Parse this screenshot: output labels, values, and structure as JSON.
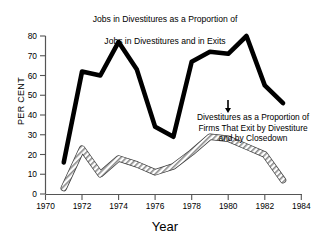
{
  "chart_data": {
    "type": "line",
    "title": "Jobs in Divestitures as a Proportion of Jobs in Divestitures and in Exits",
    "title_lines": [
      "Jobs in Divestitures as a Proportion of",
      "Jobs in Divestitures and in Exits"
    ],
    "xlabel": "Year",
    "ylabel": "PER CENT",
    "xlim": [
      1970,
      1984
    ],
    "ylim": [
      0,
      80
    ],
    "xticks": [
      1970,
      1972,
      1974,
      1976,
      1978,
      1980,
      1982,
      1984
    ],
    "xtick_labels": [
      "1970",
      "1972",
      "1974",
      "1976",
      "1978",
      "1980",
      "1982",
      "1984"
    ],
    "yticks": [
      0,
      10,
      20,
      30,
      40,
      50,
      60,
      70,
      80
    ],
    "ytick_labels": [
      "0",
      "10",
      "20",
      "30",
      "40",
      "50",
      "60",
      "70",
      "80"
    ],
    "grid": false,
    "legend": "annotations",
    "x": [
      1971,
      1972,
      1973,
      1974,
      1975,
      1976,
      1977,
      1978,
      1979,
      1980,
      1981,
      1982,
      1983
    ],
    "series": [
      {
        "name": "Jobs in Divestitures as a Proportion of Jobs in Divestitures and in Exits",
        "style": "thick-black",
        "color": "#000000",
        "values": [
          16,
          62,
          60,
          77,
          63,
          34,
          29,
          67,
          72,
          71,
          80,
          55,
          46
        ]
      },
      {
        "name": "Divestitures as a Proportion of Firms That Exit by Divestiture and by Closedown",
        "style": "hatched-grey",
        "color": "#808080",
        "values": [
          3,
          23,
          10,
          18,
          15,
          11,
          14,
          21,
          29,
          28,
          24,
          20,
          7
        ]
      }
    ],
    "annotations": [
      {
        "text": "Divestitures as a Proportion of Firms That Exit by Divestiture and by Closedown",
        "lines": [
          "Divestitures as a Proportion of",
          "Firms That Exit by Divestiture",
          "and by Closedown"
        ]
      }
    ]
  }
}
